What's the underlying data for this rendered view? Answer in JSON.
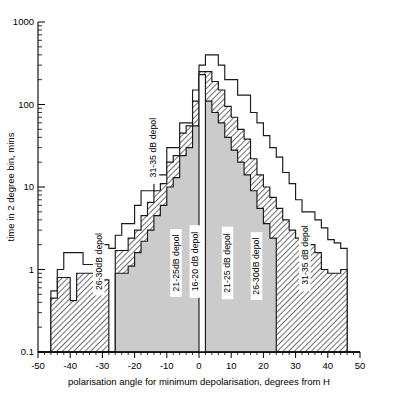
{
  "figure": {
    "background": "#ffffff",
    "ink": "#1a1a1a"
  },
  "axes": {
    "x_title": "polarisation angle for minimum depolarisation, degrees from H",
    "y_title": "time in 2 degree bin, mins",
    "x_ticklabels": [
      "-50",
      "-40",
      "-30",
      "-20",
      "-10",
      "0",
      "10",
      "20",
      "30",
      "40",
      "50"
    ],
    "x_tickvalues": [
      -50,
      -40,
      -30,
      -20,
      -10,
      0,
      10,
      20,
      30,
      40,
      50
    ],
    "y_ticklabels": [
      "1000",
      "100",
      "10",
      "1",
      "0.1"
    ],
    "y_tickvalues": [
      1000,
      100,
      10,
      1,
      0.1
    ]
  },
  "series_labels": [
    {
      "id": "lab-31-35-left",
      "text": "31-35 dB depol",
      "x": -14,
      "y": 30,
      "rot": -90
    },
    {
      "id": "lab-26-30-left",
      "text": "26-30dB depol",
      "x": -31,
      "y": 1.25,
      "rot": -90
    },
    {
      "id": "lab-21-25-left",
      "text": "21-25dB depol",
      "x": -7,
      "y": 1.2,
      "rot": -90
    },
    {
      "id": "lab-16-20",
      "text": "16-20 dB depol",
      "x": -1,
      "y": 1.25,
      "rot": -90
    },
    {
      "id": "lab-21-25-right",
      "text": "21-25 dB depol",
      "x": 9,
      "y": 1.2,
      "rot": -90
    },
    {
      "id": "lab-26-30-right",
      "text": "26-30dB depol",
      "x": 18,
      "y": 1.1,
      "rot": -90
    },
    {
      "id": "lab-31-35-right",
      "text": "31-35 dB depol",
      "x": 33,
      "y": 1.5,
      "rot": -90
    }
  ],
  "chart_data": {
    "type": "bar",
    "subtype": "nested-step-histogram-log-y",
    "title": "",
    "xlabel": "polarisation angle for minimum depolarisation, degrees from H",
    "ylabel": "time in 2 degree bin, mins",
    "xlim": [
      -50,
      50
    ],
    "ylim": [
      0.1,
      1000
    ],
    "yscale": "log",
    "bin_width": 2,
    "grid": false,
    "legend": "inline-rotated-labels",
    "bin_centers": [
      -49,
      -47,
      -45,
      -43,
      -41,
      -39,
      -37,
      -35,
      -33,
      -31,
      -29,
      -27,
      -25,
      -23,
      -21,
      -19,
      -17,
      -15,
      -13,
      -11,
      -9,
      -7,
      -5,
      -3,
      -1,
      1,
      3,
      5,
      7,
      9,
      11,
      13,
      15,
      17,
      19,
      21,
      23,
      25,
      27,
      29,
      31,
      33,
      35,
      37,
      39,
      41,
      43,
      45,
      47,
      49
    ],
    "series": [
      {
        "name": "31-35 dB depol",
        "fill": "none",
        "values": [
          0.1,
          0.1,
          0.55,
          1.0,
          1.6,
          1.6,
          1.6,
          1.15,
          1.15,
          2.0,
          2.0,
          1.8,
          2.6,
          3.6,
          3.6,
          6.0,
          9.0,
          9.0,
          14,
          14,
          30,
          30,
          60,
          60,
          150,
          300,
          400,
          400,
          300,
          200,
          200,
          130,
          130,
          80,
          60,
          42,
          30,
          23,
          15,
          11,
          7,
          5,
          5,
          4,
          3.2,
          2.3,
          2.1,
          1.8,
          0.1,
          0.1
        ]
      },
      {
        "name": "26-30 dB depol",
        "fill": "hatch",
        "values": [
          0.1,
          0.1,
          0.45,
          0.8,
          0.8,
          0.42,
          0.9,
          0.9,
          0.9,
          0.9,
          0.75,
          0.1,
          1.7,
          1.7,
          2.4,
          3.0,
          4.5,
          6.5,
          9.0,
          11,
          20,
          24,
          45,
          55,
          110,
          250,
          250,
          190,
          150,
          95,
          70,
          50,
          38,
          22,
          14,
          10,
          7.5,
          5.5,
          4.0,
          3.0,
          2.4,
          2.0,
          2.0,
          1.6,
          1.0,
          0.9,
          0.9,
          1.0,
          0.1,
          0.1
        ]
      },
      {
        "name": "21-25 dB depol",
        "fill": "gray",
        "values": [
          0.1,
          0.1,
          0.1,
          0.1,
          0.1,
          0.1,
          0.1,
          0.1,
          0.1,
          0.1,
          0.1,
          0.1,
          0.9,
          0.9,
          1.1,
          1.6,
          2.2,
          3.0,
          4.5,
          6.0,
          10,
          13,
          24,
          30,
          55,
          110,
          110,
          80,
          60,
          40,
          28,
          20,
          14,
          9,
          5.5,
          3.6,
          2.4,
          0.1,
          0.1,
          0.1,
          0.1,
          0.1,
          0.1,
          0.1,
          0.1,
          0.1,
          0.1,
          0.1,
          0.1,
          0.1
        ]
      },
      {
        "name": "16-20 dB depol",
        "fill": "white",
        "values": [
          0.1,
          0.1,
          0.1,
          0.1,
          0.1,
          0.1,
          0.1,
          0.1,
          0.1,
          0.1,
          0.1,
          0.1,
          0.1,
          0.1,
          0.1,
          0.1,
          0.1,
          0.1,
          0.1,
          0.1,
          0.1,
          0.1,
          0.1,
          0.1,
          0.1,
          230,
          0.1,
          0.1,
          0.1,
          0.1,
          0.1,
          0.1,
          0.1,
          0.1,
          0.1,
          0.1,
          0.1,
          0.1,
          0.1,
          0.1,
          0.1,
          0.1,
          0.1,
          0.1,
          0.1,
          0.1,
          0.1,
          0.1,
          0.1,
          0.1
        ]
      }
    ]
  }
}
